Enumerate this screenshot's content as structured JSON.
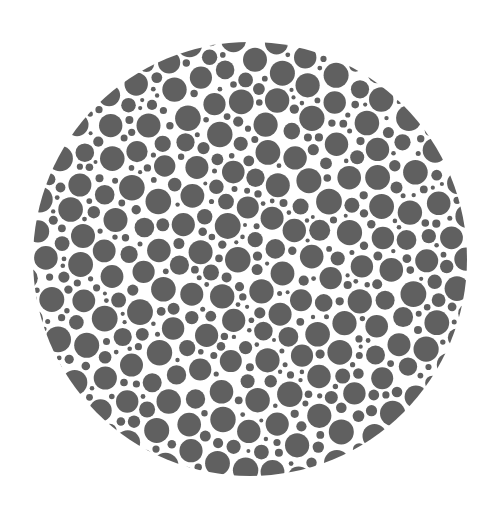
{
  "plate": {
    "type": "color-vision-test-plate",
    "description": "Circular plate filled with packed gray dots of varying sizes on white background; no visible numeral",
    "center": [
      250,
      259
    ],
    "radius": 217,
    "background_color": "#ffffff",
    "dot_color": "#606060",
    "dot_radius_range": [
      2,
      13
    ],
    "seed": 7
  }
}
